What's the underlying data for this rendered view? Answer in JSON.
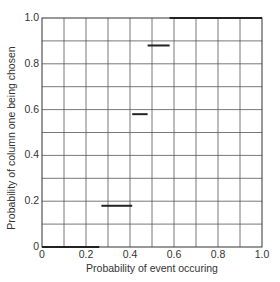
{
  "chart_data": {
    "type": "line",
    "subtype": "step",
    "title": "",
    "xlabel": "Probability of event occuring",
    "ylabel": "Probability of column one being chosen",
    "xlim": [
      0,
      1.0
    ],
    "ylim": [
      0,
      1.0
    ],
    "x_ticks": [
      "0",
      "0.2",
      "0.4",
      "0.6",
      "0.8",
      "1.0"
    ],
    "y_ticks": [
      "0",
      "0.2",
      "0.4",
      "0.6",
      "0.8",
      "1.0"
    ],
    "grid": true,
    "grid_spacing": 0.1,
    "legend": null,
    "series": [
      {
        "name": "step segments",
        "segments": [
          {
            "x_start": 0.0,
            "x_end": 0.26,
            "y": 0.0
          },
          {
            "x_start": 0.27,
            "x_end": 0.41,
            "y": 0.18
          },
          {
            "x_start": 0.41,
            "x_end": 0.48,
            "y": 0.58
          },
          {
            "x_start": 0.48,
            "x_end": 0.58,
            "y": 0.88
          },
          {
            "x_start": 0.58,
            "x_end": 1.0,
            "y": 1.0
          }
        ]
      }
    ],
    "colors": {
      "line": "#222222",
      "grid": "#555555",
      "axis": "#222222"
    }
  }
}
